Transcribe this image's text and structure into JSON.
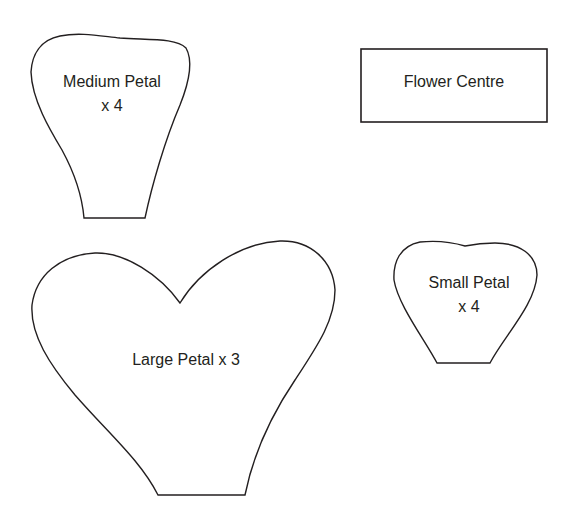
{
  "template": {
    "shapes": [
      {
        "id": "medium-petal",
        "label_line1": "Medium Petal",
        "label_line2": "x 4"
      },
      {
        "id": "flower-centre",
        "label_line1": "Flower Centre"
      },
      {
        "id": "large-petal",
        "label_line1": "Large Petal x 3"
      },
      {
        "id": "small-petal",
        "label_line1": "Small Petal",
        "label_line2": "x 4"
      }
    ],
    "stroke_color": "#231f20",
    "background": "#ffffff"
  }
}
